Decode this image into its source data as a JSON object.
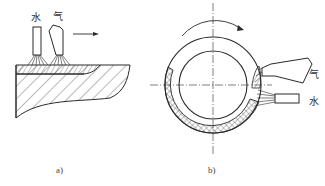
{
  "figure_a": {
    "caption": "a)",
    "water_label": "水",
    "gas_label": "气",
    "motion_arrow": "arrow-right"
  },
  "figure_b": {
    "caption": "b)",
    "water_label": "水",
    "gas_label": "气",
    "rotation_arrow": "arrow-clockwise"
  },
  "colors": {
    "line": "#2a2a2a",
    "background": "#ffffff"
  }
}
